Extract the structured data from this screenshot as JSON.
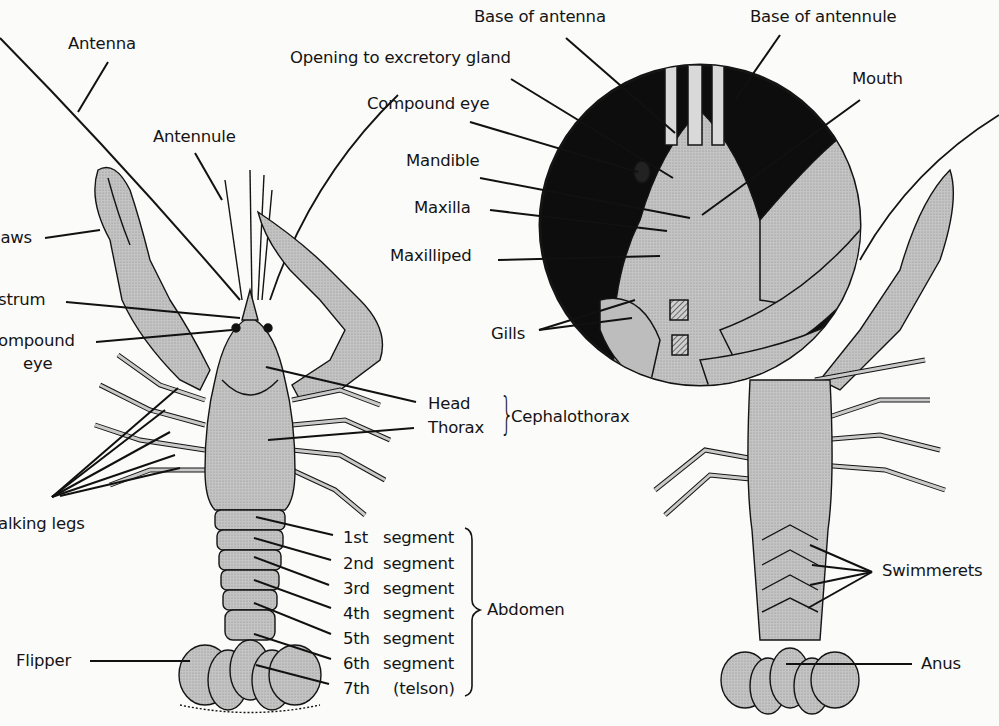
{
  "figure": {
    "colors": {
      "body_fill": "#bdbdbd",
      "outline": "#141414",
      "inset_bg": "#0d0d0d",
      "background": "#fbfbfa"
    }
  },
  "left_view": {
    "labels": {
      "antenna": "Antenna",
      "antennule": "Antennule",
      "claw": "laws",
      "rostrum": "strum",
      "compound_eye_line1": "ompound",
      "compound_eye_line2": "eye",
      "walking_legs": "alking legs",
      "flipper": "Flipper",
      "head": "Head",
      "thorax": "Thorax",
      "cephalothorax": "Cephalothorax",
      "abdomen": "Abdomen"
    },
    "abdomen_segments": [
      {
        "ordinal": "1st",
        "name": "segment"
      },
      {
        "ordinal": "2nd",
        "name": "segment"
      },
      {
        "ordinal": "3rd",
        "name": "segment"
      },
      {
        "ordinal": "4th",
        "name": "segment"
      },
      {
        "ordinal": "5th",
        "name": "segment"
      },
      {
        "ordinal": "6th",
        "name": "segment"
      },
      {
        "ordinal": "7th",
        "name": "(telson)"
      }
    ]
  },
  "inset": {
    "labels": {
      "base_of_antenna": "Base of antenna",
      "base_of_antennule": "Base of antennule",
      "opening_to_excretory_gland": "Opening to excretory gland",
      "compound_eye": "Compound eye",
      "mouth": "Mouth",
      "mandible": "Mandible",
      "maxilla": "Maxilla",
      "maxilliped": "Maxilliped",
      "gills": "Gills"
    }
  },
  "right_view": {
    "labels": {
      "swimmerets": "Swimmerets",
      "anus": "Anus"
    }
  }
}
